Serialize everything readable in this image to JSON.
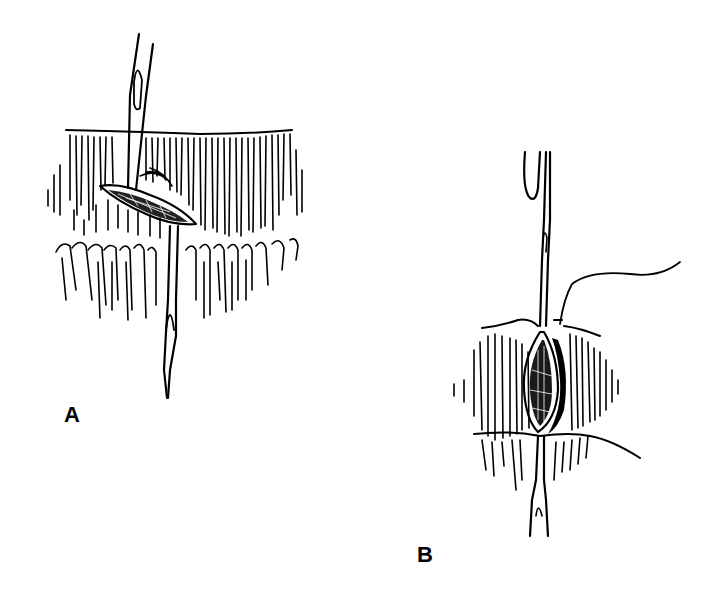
{
  "figure": {
    "panels": [
      {
        "id": "A",
        "label": "A",
        "description": "Needle passing through tissue across an elongated incision (horizontal view)"
      },
      {
        "id": "B",
        "label": "B",
        "description": "Needle passing vertically through incision with suture thread extending to the right"
      }
    ],
    "colors": {
      "ink": "#000000",
      "background": "#ffffff"
    }
  }
}
